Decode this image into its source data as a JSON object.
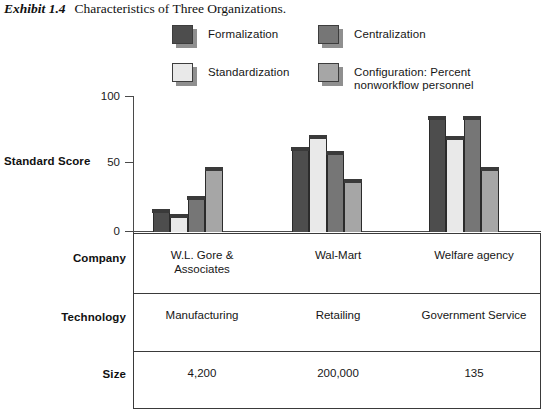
{
  "title": {
    "exhibit_number": "Exhibit 1.4",
    "caption": "Characteristics of Three Organizations."
  },
  "legend": {
    "items": [
      {
        "label": "Formalization",
        "color": "#4d4d4d"
      },
      {
        "label": "Centralization",
        "color": "#767676"
      },
      {
        "label": "Standardization",
        "color": "#e9e9e9"
      },
      {
        "label": "Configuration: Percent\nnonworkflow personnel",
        "color": "#a6a6a6"
      }
    ]
  },
  "chart_data": {
    "type": "bar",
    "title": "Characteristics of Three Organizations.",
    "xlabel": "",
    "ylabel": "Standard Score",
    "ylim": [
      0,
      100
    ],
    "yticks": [
      0,
      50,
      100
    ],
    "grid": false,
    "legend_position": "top",
    "categories": [
      "W.L. Gore &\nAssociates",
      "Wal-Mart",
      "Welfare agency"
    ],
    "series": [
      {
        "name": "Formalization",
        "color": "#4d4d4d",
        "values": [
          17,
          63,
          86
        ]
      },
      {
        "name": "Standardization",
        "color": "#e9e9e9",
        "values": [
          13,
          72,
          71
        ]
      },
      {
        "name": "Centralization",
        "color": "#767676",
        "values": [
          27,
          60,
          86
        ]
      },
      {
        "name": "Configuration: Percent nonworkflow personnel",
        "color": "#a6a6a6",
        "values": [
          48,
          39,
          48
        ]
      }
    ]
  },
  "table": {
    "rows": [
      {
        "label": "Company",
        "cells": [
          "W.L. Gore &\nAssociates",
          "Wal-Mart",
          "Welfare agency"
        ]
      },
      {
        "label": "Technology",
        "cells": [
          "Manufacturing",
          "Retailing",
          "Government Service"
        ]
      },
      {
        "label": "Size",
        "cells": [
          "4,200",
          "200,000",
          "135"
        ]
      }
    ]
  },
  "axis": {
    "label": "Standard Score",
    "tick_100": "100",
    "tick_50": "50",
    "tick_0": "0"
  }
}
